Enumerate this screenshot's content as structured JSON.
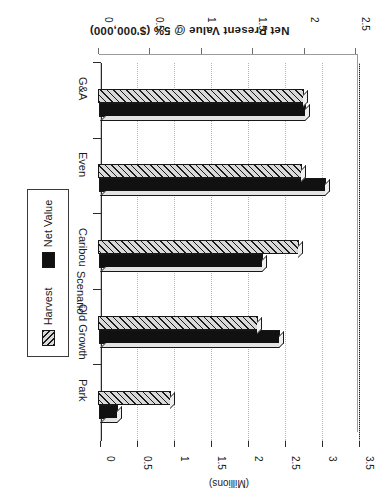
{
  "figure": {
    "title": "Net Present Value @ 5% ($'000,000)",
    "value_axis_title": "(Millions)",
    "category_axis_title": "Scenario",
    "orientation_note": "rotated-180"
  },
  "legend": {
    "position": "right",
    "items": [
      {
        "label": "Harvest",
        "swatch": "hatched-diagonal",
        "color": "#d9d9d9"
      },
      {
        "label": "Net Value",
        "swatch": "solid-black",
        "color": "#111111"
      }
    ]
  },
  "axes": {
    "far": {
      "name": "Net Value axis (back plane)",
      "ticks": [
        "3.5",
        "3",
        "2.5",
        "2",
        "1.5",
        "1",
        "0.5",
        "0"
      ],
      "min": 0,
      "max": 3.5
    },
    "near": {
      "name": "Harvest axis (front plane)",
      "ticks": [
        "2.5",
        "2",
        "1.5",
        "1",
        "0.5",
        "0"
      ],
      "min": 0,
      "max": 2.5
    }
  },
  "chart_data": {
    "type": "bar",
    "orientation": "horizontal",
    "title": "Net Present Value @ 5% ($'000,000)",
    "xlabel": "(Millions)",
    "ylabel": "Scenario",
    "xlim": [
      0,
      3.5
    ],
    "grid": true,
    "legend_position": "right",
    "categories": [
      "G&A",
      "Even",
      "Caribou",
      "Old Growth",
      "Park"
    ],
    "series": [
      {
        "name": "Harvest",
        "values": [
          2.0,
          1.98,
          1.96,
          1.56,
          0.71
        ]
      },
      {
        "name": "Net Value",
        "values": [
          2.8,
          3.07,
          2.22,
          2.44,
          0.26
        ]
      }
    ],
    "units": "millions of dollars"
  }
}
